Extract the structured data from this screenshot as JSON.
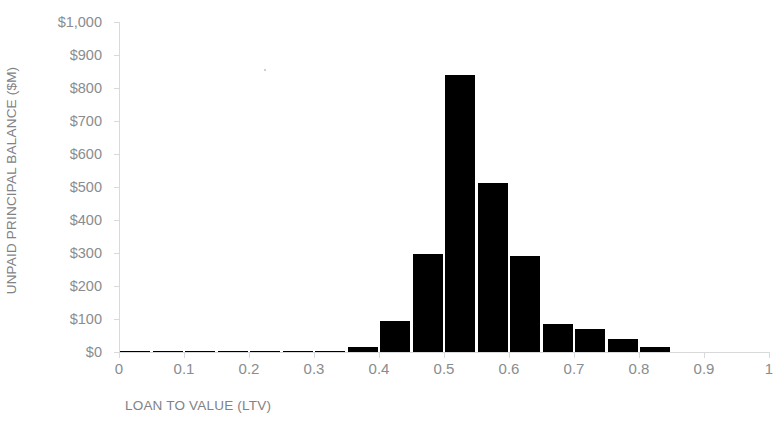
{
  "chart_data": {
    "type": "bar",
    "title": "",
    "subtitle": "",
    "xlabel": "LOAN TO VALUE (LTV)",
    "ylabel": "UNPAID PRINCIPAL BALANCE ($M)",
    "xlim": [
      0,
      1
    ],
    "ylim": [
      0,
      1000
    ],
    "grid": false,
    "legend": null,
    "bar_color": "#000000",
    "axis_color": "#d8d9da",
    "tick_label_color": "#8a8c8e",
    "axis_title_color": "#808285",
    "bin_width": 0.05,
    "x_ticks": [
      "0",
      "0.1",
      "0.2",
      "0.3",
      "0.4",
      "0.5",
      "0.6",
      "0.7",
      "0.8",
      "0.9",
      "1"
    ],
    "x_tick_values": [
      0,
      0.1,
      0.2,
      0.3,
      0.4,
      0.5,
      0.6,
      0.7,
      0.8,
      0.9,
      1
    ],
    "y_ticks": [
      "$0",
      "$100",
      "$200",
      "$300",
      "$400",
      "$500",
      "$600",
      "$700",
      "$800",
      "$900",
      "$1,000"
    ],
    "y_tick_values": [
      0,
      100,
      200,
      300,
      400,
      500,
      600,
      700,
      800,
      900,
      1000
    ],
    "categories": [
      0.025,
      0.075,
      0.125,
      0.175,
      0.225,
      0.275,
      0.325,
      0.375,
      0.425,
      0.475,
      0.525,
      0.575,
      0.625,
      0.675,
      0.725,
      0.775,
      0.825,
      0.875
    ],
    "bin_edges": [
      0.0,
      0.05,
      0.1,
      0.15,
      0.2,
      0.25,
      0.3,
      0.35,
      0.4,
      0.45,
      0.5,
      0.55,
      0.6,
      0.65,
      0.7,
      0.75,
      0.8,
      0.85,
      0.9
    ],
    "values": [
      1,
      1,
      1,
      1,
      1,
      1,
      1,
      14,
      95,
      297,
      840,
      513,
      291,
      85,
      70,
      40,
      15,
      0
    ]
  }
}
